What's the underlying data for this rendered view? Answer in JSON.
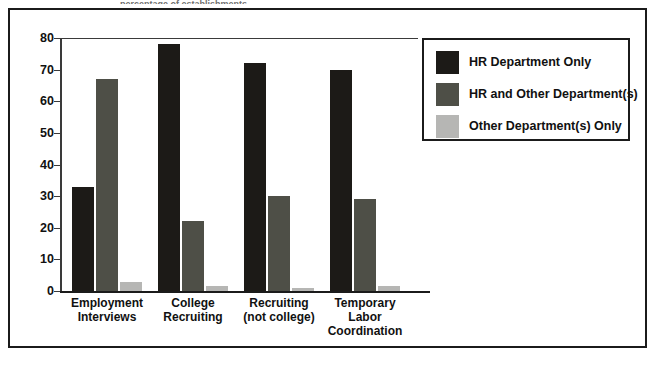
{
  "figure": {
    "top_sliver_text": "percentage of establishments",
    "frame_color": "#1b1b1b",
    "background": "#ffffff"
  },
  "chart_data": {
    "type": "bar",
    "title": "",
    "subtitle": "",
    "xlabel": "",
    "ylabel": "",
    "ylim": [
      0,
      80
    ],
    "yticks": [
      0,
      10,
      20,
      30,
      40,
      50,
      60,
      70,
      80
    ],
    "ytick_labels": [
      "0",
      "10",
      "20",
      "30",
      "40",
      "50",
      "60",
      "70",
      "80"
    ],
    "grid": false,
    "legend_position": "right",
    "categories": [
      "Employment Interviews",
      "College Recruiting",
      "Recruiting (not college)",
      "Temporary Labor Coordination"
    ],
    "category_lines": [
      [
        "Employment",
        "Interviews"
      ],
      [
        "College",
        "Recruiting"
      ],
      [
        "Recruiting",
        "(not college)"
      ],
      [
        "Temporary",
        "Labor",
        "Coordination"
      ]
    ],
    "series": [
      {
        "name": "HR Department Only",
        "color": "#1c1a17",
        "values": [
          33,
          78,
          72,
          70
        ]
      },
      {
        "name": "HR and Other Department(s)",
        "color": "#4e4f47",
        "values": [
          67,
          22,
          30,
          29
        ]
      },
      {
        "name": "Other Department(s) Only",
        "color": "#b6b6b4",
        "values": [
          3,
          1.5,
          1,
          1.5
        ]
      }
    ]
  },
  "legend": {
    "items": [
      {
        "label": "HR Department Only",
        "color": "#1c1a17"
      },
      {
        "label": "HR and Other Department(s)",
        "color": "#4e4f47"
      },
      {
        "label": "Other Department(s) Only",
        "color": "#b6b6b4"
      }
    ]
  }
}
